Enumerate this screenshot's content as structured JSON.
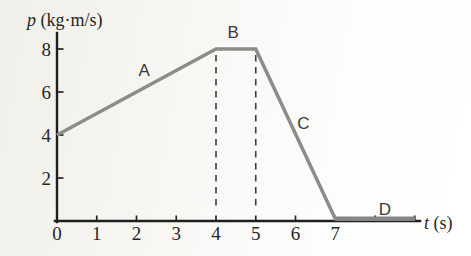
{
  "chart_data": {
    "type": "line",
    "title": "",
    "xlabel_symbol": "t",
    "xlabel_units": " (s)",
    "ylabel_symbol": "p",
    "ylabel_units": " (kg·m/s)",
    "xlim": [
      0,
      9.2
    ],
    "ylim": [
      0,
      8.8
    ],
    "grid": false,
    "legend": "none",
    "points": [
      [
        0,
        4
      ],
      [
        4,
        8
      ],
      [
        5,
        8
      ],
      [
        7,
        0
      ],
      [
        9,
        0
      ]
    ],
    "x_ticks": [
      {
        "t": 0,
        "label": "0",
        "tick": false
      },
      {
        "t": 1,
        "label": "1",
        "tick": true
      },
      {
        "t": 2,
        "label": "2",
        "tick": true
      },
      {
        "t": 3,
        "label": "3",
        "tick": true
      },
      {
        "t": 4,
        "label": "4",
        "tick": true
      },
      {
        "t": 5,
        "label": "5",
        "tick": true
      },
      {
        "t": 6,
        "label": "6",
        "tick": true
      },
      {
        "t": 7,
        "label": "7",
        "tick": true
      },
      {
        "t": 8,
        "label": "",
        "tick": true
      },
      {
        "t": 9,
        "label": "",
        "tick": true
      }
    ],
    "y_ticks": [
      {
        "p": 2,
        "label": "2"
      },
      {
        "p": 4,
        "label": "4"
      },
      {
        "p": 6,
        "label": "6"
      },
      {
        "p": 8,
        "label": "8"
      }
    ],
    "dashed_guides": [
      {
        "x": 4,
        "y_from": 0,
        "y_to": 8
      },
      {
        "x": 5,
        "y_from": 0,
        "y_to": 8
      }
    ],
    "annotations": [
      {
        "text": "A",
        "t": 2.19,
        "p": 6.75
      },
      {
        "text": "B",
        "t": 4.43,
        "p": 8.5
      },
      {
        "text": "C",
        "t": 6.2,
        "p": 4.3
      },
      {
        "text": "D",
        "t": 8.25,
        "p": 0.3
      }
    ],
    "colors": {
      "series_line": "#8c8c8c",
      "axis": "#1f1f1f",
      "dashed_guide": "#3c3c3c",
      "text": "#262626",
      "background": "#f7f5f1"
    }
  }
}
